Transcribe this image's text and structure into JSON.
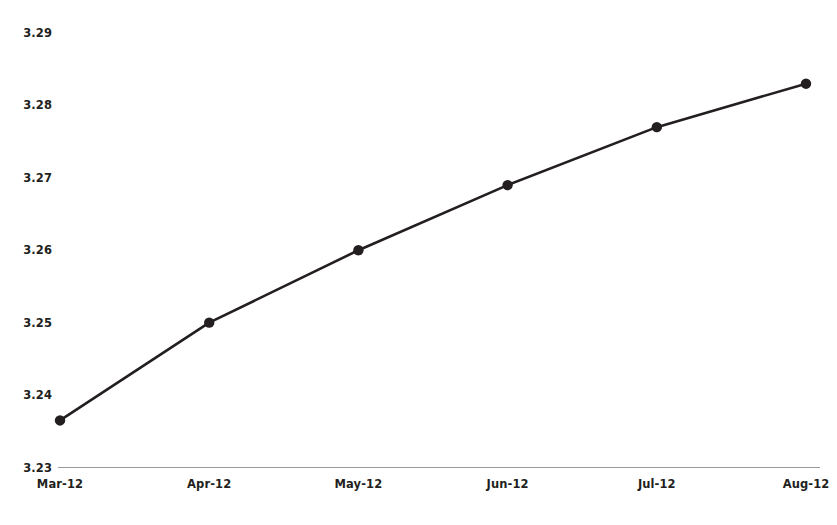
{
  "chart_data": {
    "type": "line",
    "title": "",
    "xlabel": "",
    "ylabel": "",
    "categories": [
      "Mar-12",
      "Apr-12",
      "May-12",
      "Jun-12",
      "Jul-12",
      "Aug-12"
    ],
    "values": [
      3.2365,
      3.25,
      3.26,
      3.269,
      3.277,
      3.283
    ],
    "yticks": [
      "3.23",
      "3.24",
      "3.25",
      "3.26",
      "3.27",
      "3.28",
      "3.29"
    ],
    "ytick_values": [
      3.23,
      3.24,
      3.25,
      3.26,
      3.27,
      3.28,
      3.29
    ],
    "ylim": [
      3.23,
      3.29
    ],
    "grid": false,
    "legend": false,
    "series": [
      {
        "name": "",
        "values": [
          3.2365,
          3.25,
          3.26,
          3.269,
          3.277,
          3.283
        ],
        "color": "#231f20",
        "marker": "circle"
      }
    ],
    "colors": {
      "line": "#231f20",
      "marker": "#231f20",
      "axis": "#9a9a96",
      "text": "#231f20",
      "background": "#ffffff"
    }
  }
}
